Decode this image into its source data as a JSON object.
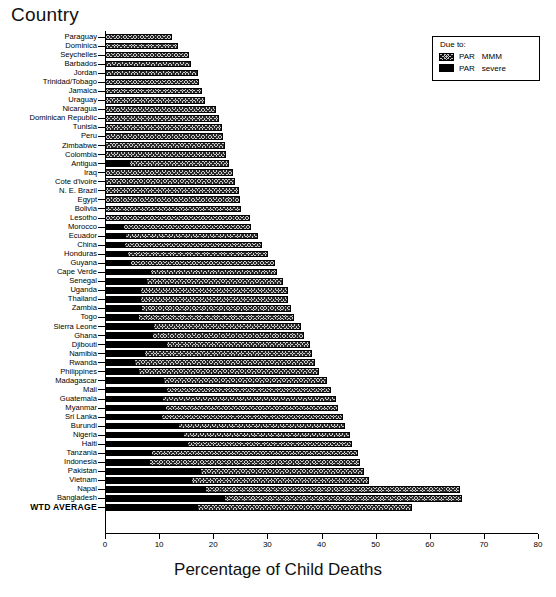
{
  "header": {
    "country_axis_title": "Country"
  },
  "legend": {
    "title": "Due to:",
    "entries": [
      {
        "label_a": "PAR",
        "label_b": "MMM",
        "swatch": "hatched"
      },
      {
        "label_a": "PAR",
        "label_b": "severe",
        "swatch": "solid-black"
      }
    ]
  },
  "axis": {
    "x_title": "Percentage of Child Deaths",
    "x_ticks": [
      0,
      10,
      20,
      30,
      40,
      50,
      60,
      70,
      80
    ]
  },
  "chart_data": {
    "type": "bar",
    "orientation": "horizontal",
    "stacked": true,
    "title": "",
    "xlabel": "Percentage of Child Deaths",
    "ylabel": "Country",
    "xlim": [
      0,
      80
    ],
    "grid": false,
    "legend_position": "top-right",
    "categories": [
      "Paraguay",
      "Dominica",
      "Seychelles",
      "Barbados",
      "Jordan",
      "Trinidad/Tobago",
      "Jamaica",
      "Uraguay",
      "Nicaragua",
      "Dominican Republic",
      "Tunisia",
      "Peru",
      "Zimbabwe",
      "Colombia",
      "Antigua",
      "Iraq",
      "Cote d'ivoire",
      "N. E. Brazil",
      "Egypt",
      "Bolivia",
      "Lesotho",
      "Morocco",
      "Ecuador",
      "China",
      "Honduras",
      "Guyana",
      "Cape Verde",
      "Senegal",
      "Uganda",
      "Thailand",
      "Zambia",
      "Togo",
      "Sierra Leone",
      "Ghana",
      "Djibouti",
      "Namibia",
      "Rwanda",
      "Philippines",
      "Madagascar",
      "Mali",
      "Guatemala",
      "Myanmar",
      "Sri Lanka",
      "Burundi",
      "Nigeria",
      "Haiti",
      "Tanzania",
      "Indonesia",
      "Pakistan",
      "Vietnam",
      "Napal",
      "Bangladesh",
      "WTD AVERAGE"
    ],
    "series": [
      {
        "name": "PAR severe",
        "values": [
          0.0,
          0.0,
          0.0,
          0.0,
          0.0,
          0.0,
          0.0,
          0.0,
          0.0,
          0.0,
          0.0,
          0.0,
          0.0,
          0.0,
          4.6,
          0.0,
          0.0,
          0.0,
          0.0,
          0.0,
          0.0,
          3.4,
          3.8,
          3.6,
          4.2,
          4.6,
          8.4,
          7.6,
          6.6,
          6.6,
          6.8,
          6.2,
          9.0,
          8.8,
          11.4,
          7.2,
          5.4,
          6.1,
          10.8,
          11.4,
          10.6,
          11.2,
          10.4,
          13.6,
          14.6,
          15.2,
          8.6,
          8.2,
          17.6,
          16.0,
          18.6,
          22.2,
          17.2
        ]
      },
      {
        "name": "PAR MMM",
        "values": [
          12.4,
          13.4,
          15.6,
          15.8,
          17.2,
          17.4,
          18.0,
          18.4,
          20.6,
          21.0,
          21.6,
          21.8,
          22.2,
          22.4,
          18.4,
          23.6,
          24.0,
          24.8,
          25.0,
          25.2,
          26.8,
          23.6,
          24.4,
          25.4,
          26.0,
          26.8,
          23.4,
          25.2,
          27.2,
          27.2,
          27.6,
          28.8,
          27.2,
          28.0,
          26.4,
          31.0,
          33.4,
          33.5,
          30.2,
          30.4,
          32.0,
          31.8,
          33.6,
          30.8,
          30.6,
          30.4,
          38.2,
          39.0,
          30.2,
          32.8,
          47.0,
          43.8,
          39.6
        ]
      }
    ],
    "totals": [
      12.4,
      13.4,
      15.6,
      15.8,
      17.2,
      17.4,
      18.0,
      18.4,
      20.6,
      21.0,
      21.6,
      21.8,
      22.2,
      22.4,
      23.0,
      23.6,
      24.0,
      24.8,
      25.0,
      25.2,
      26.8,
      27.0,
      28.2,
      29.0,
      30.2,
      31.4,
      31.8,
      32.8,
      33.8,
      33.8,
      34.4,
      35.0,
      36.2,
      36.8,
      37.8,
      38.2,
      38.8,
      39.6,
      41.0,
      41.8,
      42.6,
      43.0,
      44.0,
      44.4,
      45.2,
      45.6,
      46.8,
      47.2,
      47.8,
      48.8,
      65.6,
      66.0,
      56.8
    ]
  }
}
